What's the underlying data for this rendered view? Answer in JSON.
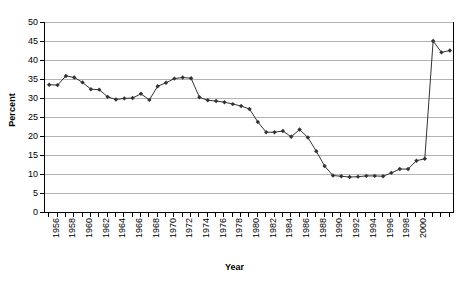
{
  "chart_data": {
    "type": "line",
    "title": "",
    "xlabel": "Year",
    "ylabel": "Percent",
    "ylim": [
      0,
      50
    ],
    "ytick_step": 5,
    "xlim": [
      1956,
      2002
    ],
    "xtick_step": 1,
    "xlabel_step": 2,
    "grid": "horizontal",
    "legend": "none",
    "marker": "diamond",
    "series_color": "#333333",
    "gridline_color": "#b3b3b3",
    "axis_color": "#000000",
    "ytick_labels": [
      0,
      5,
      10,
      15,
      20,
      25,
      30,
      35,
      40,
      45,
      50
    ],
    "xtick_labels": [
      "1956",
      "1958",
      "1960",
      "1962",
      "1964",
      "1966",
      "1968",
      "1970",
      "1972",
      "1974",
      "1976",
      "1978",
      "1980",
      "1982",
      "1984",
      "1986",
      "1988",
      "1990",
      "1992",
      "1994",
      "1996",
      "1998",
      "2000"
    ],
    "x": [
      1956,
      1957,
      1958,
      1959,
      1960,
      1961,
      1962,
      1963,
      1964,
      1965,
      1966,
      1967,
      1968,
      1969,
      1970,
      1971,
      1972,
      1973,
      1974,
      1975,
      1976,
      1977,
      1978,
      1979,
      1980,
      1981,
      1982,
      1983,
      1984,
      1985,
      1986,
      1987,
      1988,
      1989,
      1990,
      1991,
      1992,
      1993,
      1994,
      1995,
      1996,
      1997,
      1998,
      1999,
      2000,
      2001,
      2002
    ],
    "values": [
      33.5,
      33.4,
      35.8,
      35.4,
      34.1,
      32.3,
      32.2,
      30.3,
      29.6,
      29.9,
      30.0,
      31.1,
      29.5,
      33.1,
      34.0,
      35.1,
      35.4,
      35.2,
      30.2,
      29.4,
      29.2,
      28.9,
      28.4,
      27.9,
      27.1,
      23.7,
      21.0,
      21.0,
      21.3,
      19.8,
      21.7,
      19.6,
      16.0,
      12.1,
      9.6,
      9.4,
      9.2,
      9.3,
      9.5,
      9.5,
      9.4,
      10.3,
      11.3,
      11.3,
      13.5,
      14.0,
      45.0
    ],
    "values_note": "series plotted per-year from 1956 through 2002"
  },
  "chart_series_points": [
    {
      "year": "1956",
      "value": 33.5
    },
    {
      "year": "1957",
      "value": 33.4
    },
    {
      "year": "1958",
      "value": 35.8
    },
    {
      "year": "1959",
      "value": 35.4
    },
    {
      "year": "1960",
      "value": 34.1
    },
    {
      "year": "1961",
      "value": 32.3
    },
    {
      "year": "1962",
      "value": 32.2
    },
    {
      "year": "1963",
      "value": 30.3
    },
    {
      "year": "1964",
      "value": 29.6
    },
    {
      "year": "1965",
      "value": 29.9
    },
    {
      "year": "1966",
      "value": 30.0
    },
    {
      "year": "1967",
      "value": 31.1
    },
    {
      "year": "1968",
      "value": 29.5
    },
    {
      "year": "1969",
      "value": 33.1
    },
    {
      "year": "1970",
      "value": 34.0
    },
    {
      "year": "1971",
      "value": 35.1
    },
    {
      "year": "1972",
      "value": 35.4
    },
    {
      "year": "1973",
      "value": 35.2
    },
    {
      "year": "1974",
      "value": 30.2
    },
    {
      "year": "1975",
      "value": 29.4
    },
    {
      "year": "1976",
      "value": 29.2
    },
    {
      "year": "1977",
      "value": 28.9
    },
    {
      "year": "1978",
      "value": 28.4
    },
    {
      "year": "1979",
      "value": 27.9
    },
    {
      "year": "1980",
      "value": 27.1
    },
    {
      "year": "1981",
      "value": 23.7
    },
    {
      "year": "1982",
      "value": 21.0
    },
    {
      "year": "1983",
      "value": 21.0
    },
    {
      "year": "1984",
      "value": 21.3
    },
    {
      "year": "1985",
      "value": 19.8
    },
    {
      "year": "1986",
      "value": 21.7
    },
    {
      "year": "1987",
      "value": 19.6
    },
    {
      "year": "1988",
      "value": 16.0
    },
    {
      "year": "1989",
      "value": 12.1
    },
    {
      "year": "1990",
      "value": 9.6
    },
    {
      "year": "1991",
      "value": 9.4
    },
    {
      "year": "1992",
      "value": 9.2
    },
    {
      "year": "1993",
      "value": 9.3
    },
    {
      "year": "1994",
      "value": 9.5
    },
    {
      "year": "1995",
      "value": 9.5
    },
    {
      "year": "1996",
      "value": 9.4
    },
    {
      "year": "1997",
      "value": 10.3
    },
    {
      "year": "1998",
      "value": 11.3
    },
    {
      "year": "1999",
      "value": 11.3
    },
    {
      "year": "2000",
      "value": 13.5
    },
    {
      "year": "2001",
      "value": 14.0
    },
    {
      "year": "2002",
      "value": 45.0
    },
    {
      "year": "2003",
      "value": 42.0
    },
    {
      "year": "2004",
      "value": 42.5
    }
  ],
  "axes": {
    "y_title": "Percent",
    "x_title": "Year"
  }
}
